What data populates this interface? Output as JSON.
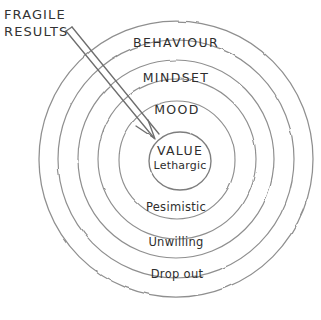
{
  "canvas": {
    "width": 321,
    "height": 320,
    "background": "#ffffff",
    "ink_color": "#8a8a8a",
    "text_color": "#2e2e2e"
  },
  "annotation": {
    "name": "fragile-results-annotation",
    "line1": "FRAGILE",
    "line2": "RESULTS",
    "pointer_target": "value-core"
  },
  "diagram": {
    "type": "concentric-circles",
    "center_x": 176,
    "center_y": 159,
    "rings": [
      {
        "label": "BEHAVIOUR",
        "style": "caps",
        "radius": 137,
        "label_y": 36,
        "label_x": 176
      },
      {
        "label": "MINDSET",
        "style": "caps",
        "radius": 118,
        "label_y": 71,
        "label_x": 176
      },
      {
        "label": "MOOD",
        "style": "caps",
        "radius": 98,
        "label_y": 103,
        "label_x": 176
      },
      {
        "label": "Pesimistic",
        "style": "lower",
        "radius": 68,
        "label_y": 201,
        "label_x": 176
      },
      {
        "label": "Unwilling",
        "style": "lower",
        "radius": 33,
        "label_y": 236,
        "label_x": 176
      },
      {
        "label": "Drop out",
        "style": "lower",
        "radius": 30,
        "label_y": 268,
        "label_x": 176
      }
    ],
    "core": {
      "title": "VALUE",
      "subtitle": "Lethargic",
      "radius": 30,
      "center_x": 180,
      "center_y": 161
    }
  }
}
